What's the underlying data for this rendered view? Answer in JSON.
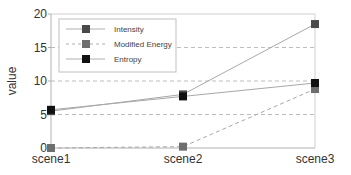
{
  "chart_data": {
    "type": "line",
    "title": "",
    "xlabel": "",
    "ylabel": "value",
    "categories": [
      "scene1",
      "scene2",
      "scene3"
    ],
    "ylim": [
      0,
      20
    ],
    "yticks": [
      0,
      5,
      10,
      15,
      20
    ],
    "grid": "horizontal dashed at 5, 10, 15",
    "legend_position": "upper left",
    "series": [
      {
        "name": "Intensity",
        "values": [
          5.5,
          8.0,
          18.5
        ],
        "color": "#4a4a4a",
        "linestyle": "solid"
      },
      {
        "name": "Modified Energy",
        "values": [
          0.0,
          0.2,
          8.8
        ],
        "color": "#6e6e6e",
        "linestyle": "dashed"
      },
      {
        "name": "Entropy",
        "values": [
          5.7,
          7.7,
          9.7
        ],
        "color": "#111111",
        "linestyle": "solid"
      }
    ]
  },
  "legend": {
    "items": [
      "Intensity",
      "Modified Energy",
      "Entropy"
    ]
  },
  "axes": {
    "ylabel": "value",
    "yticks": [
      "0",
      "5",
      "10",
      "15",
      "20"
    ],
    "xticks": [
      "scene1",
      "scene2",
      "scene3"
    ]
  }
}
